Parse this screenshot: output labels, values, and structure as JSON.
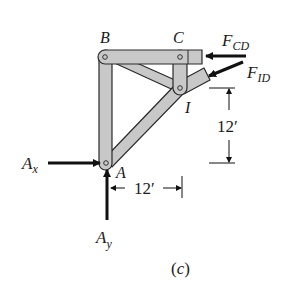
{
  "figure": {
    "caption": "(c)",
    "joints": {
      "B": "B",
      "C": "C",
      "I": "I",
      "A": "A"
    },
    "forces": {
      "Ax": {
        "main": "A",
        "sub": "x"
      },
      "Ay": {
        "main": "A",
        "sub": "y"
      },
      "FCD": {
        "main": "F",
        "sub": "CD"
      },
      "FID": {
        "main": "F",
        "sub": "ID"
      }
    },
    "dimensions": {
      "vertical": "12′",
      "horizontal": "12′"
    },
    "colors": {
      "member_fill": "#c8c8c8",
      "member_stroke": "#2a2a2a",
      "arrow": "#111111"
    }
  }
}
